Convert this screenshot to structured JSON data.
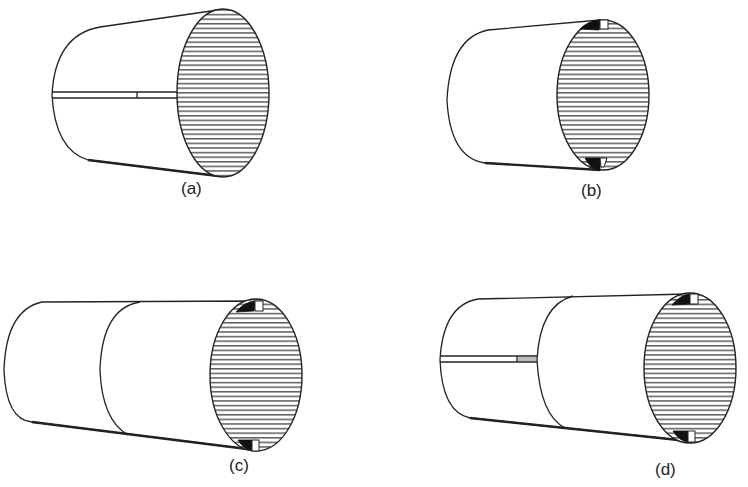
{
  "figure": {
    "panels": [
      {
        "id": "a",
        "label": "(a)",
        "description": "single cylinder segment with longitudinal slit, hatched end face"
      },
      {
        "id": "b",
        "label": "(b)",
        "description": "single cylinder segment with top and bottom notches on end face"
      },
      {
        "id": "c",
        "label": "(c)",
        "description": "two joined cylinder segments with top and bottom notches"
      },
      {
        "id": "d",
        "label": "(d)",
        "description": "two joined cylinder segments with slit on rear segment and top and bottom notches"
      }
    ],
    "colors": {
      "line": "#222222",
      "fill": "#111111",
      "background": "#ffffff"
    }
  }
}
